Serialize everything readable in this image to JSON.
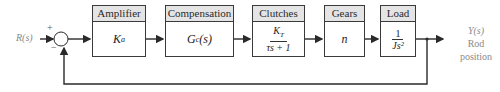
{
  "diagram": {
    "input_label": "R(s)",
    "summing_junction": {
      "plus": "+",
      "minus": "−"
    },
    "blocks": [
      {
        "header": "Amplifier",
        "num": "K",
        "sub": "a",
        "type": "sub"
      },
      {
        "header": "Compensation",
        "num": "G",
        "sub": "c",
        "tail": "(s)",
        "type": "subtail"
      },
      {
        "header": "Clutches",
        "num": "K",
        "sub": "T",
        "den": "τs + 1",
        "type": "frac"
      },
      {
        "header": "Gears",
        "num": "n",
        "type": "plain"
      },
      {
        "header": "Load",
        "num": "1",
        "den": "Js²",
        "type": "frac"
      }
    ],
    "output_label": "Y(s)",
    "output_desc_1": "Rod",
    "output_desc_2": "position",
    "colors": {
      "line": "#2a2a2a",
      "header_bg": "#e4e4e4",
      "label": "#8a8a8a"
    }
  }
}
